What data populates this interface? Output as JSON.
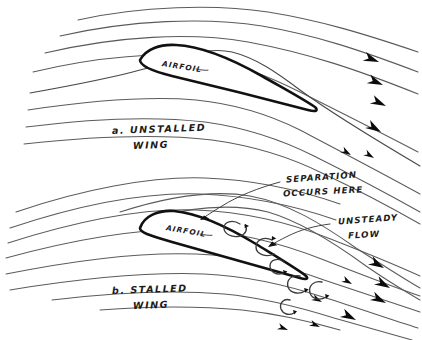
{
  "figure": {
    "background_color": "#ffffff",
    "ink_color": "#1b1b1b",
    "streamline_color": "#5b5b5b",
    "airfoil_outline_color": "#111111",
    "style": "hand-drawn pen sketch"
  },
  "panel_a": {
    "caption_line1": "a. UNSTALLED",
    "caption_line2": "WING",
    "airfoil_label": "AIRFOIL",
    "streamline_count": 8,
    "arrowhead_count": 6,
    "description": "Smooth attached streamlines follow the airfoil contour"
  },
  "panel_b": {
    "caption_line1": "b. STALLED",
    "caption_line2": "WING",
    "airfoil_label": "AIRFOIL",
    "streamline_count": 8,
    "arrowhead_count": 8,
    "eddy_count": 6,
    "description": "Flow separates from the upper surface forming eddies"
  },
  "callouts": {
    "separation_line1": "SEPARATION",
    "separation_line2": "OCCURS HERE",
    "unsteady_line1": "UNSTEADY",
    "unsteady_line2": "FLOW"
  }
}
